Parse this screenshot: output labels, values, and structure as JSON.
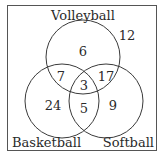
{
  "diagram": {
    "type": "venn",
    "sets": [
      {
        "name": "Volleyball",
        "label": "Volleyball"
      },
      {
        "name": "Basketball",
        "label": "Basketball"
      },
      {
        "name": "Softball",
        "label": "Softball"
      }
    ],
    "regions": {
      "volleyball_only": "6",
      "basketball_only": "24",
      "softball_only": "9",
      "volleyball_basketball_only": "7",
      "volleyball_softball_only": "17",
      "basketball_softball_only": "5",
      "all_three": "3",
      "none": "12"
    },
    "colors": {
      "stroke": "#3a3a3a",
      "text": "#2a2a2a",
      "background": "#ffffff"
    }
  }
}
